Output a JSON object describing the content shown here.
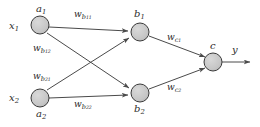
{
  "figure": {
    "type": "neural-network-diagram",
    "background_color": "#ffffff",
    "node_fill": "#c8c8c8",
    "node_stroke": "#3a3a3a",
    "edge_color": "#4a4a4a",
    "text_color": "#2b2b2b"
  },
  "inputs": [
    {
      "id": "x1",
      "signal": "x",
      "signal_sub": "1",
      "node": "a",
      "node_sub": "1",
      "cx": 40,
      "cy": 25
    },
    {
      "id": "x2",
      "signal": "x",
      "signal_sub": "2",
      "node": "a",
      "node_sub": "2",
      "cx": 40,
      "cy": 98
    }
  ],
  "hidden": [
    {
      "id": "b1",
      "node": "b",
      "node_sub": "1",
      "cx": 140,
      "cy": 32
    },
    {
      "id": "b2",
      "node": "b",
      "node_sub": "2",
      "cx": 140,
      "cy": 93
    }
  ],
  "output": {
    "id": "c",
    "node": "c",
    "cx": 213,
    "cy": 62,
    "signal": "y"
  },
  "weights": {
    "input_to_hidden": [
      {
        "id": "w_b11",
        "symbol": "w",
        "sub": "b",
        "sub2": "11",
        "from": "x1",
        "to": "b1"
      },
      {
        "id": "w_b12",
        "symbol": "w",
        "sub": "b",
        "sub2": "12",
        "from": "x1",
        "to": "b2"
      },
      {
        "id": "w_b21",
        "symbol": "w",
        "sub": "b",
        "sub2": "21",
        "from": "x2",
        "to": "b1"
      },
      {
        "id": "w_b22",
        "symbol": "w",
        "sub": "b",
        "sub2": "22",
        "from": "x2",
        "to": "b2"
      }
    ],
    "hidden_to_output": [
      {
        "id": "w_c1",
        "symbol": "w",
        "sub": "c",
        "sub2": "1",
        "from": "b1",
        "to": "c"
      },
      {
        "id": "w_c2",
        "symbol": "w",
        "sub": "c",
        "sub2": "2",
        "from": "b2",
        "to": "c"
      }
    ]
  },
  "labels": {
    "x1": "x",
    "x1_sub": "1",
    "x2": "x",
    "x2_sub": "2",
    "a1": "a",
    "a1_sub": "1",
    "a2": "a",
    "a2_sub": "2",
    "b1": "b",
    "b1_sub": "1",
    "b2": "b",
    "b2_sub": "2",
    "c": "c",
    "y": "y",
    "w_b11": "w",
    "w_b11_sub": "b",
    "w_b11_sub2": "11",
    "w_b12": "w",
    "w_b12_sub": "b",
    "w_b12_sub2": "12",
    "w_b21": "w",
    "w_b21_sub": "b",
    "w_b21_sub2": "21",
    "w_b22": "w",
    "w_b22_sub": "b",
    "w_b22_sub2": "22",
    "w_c1": "w",
    "w_c1_sub": "c",
    "w_c1_sub2": "1",
    "w_c2": "w",
    "w_c2_sub": "c",
    "w_c2_sub2": "2"
  }
}
